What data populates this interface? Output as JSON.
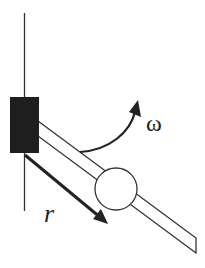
{
  "diagram": {
    "labels": {
      "omega": "ω",
      "r": "r"
    },
    "colors": {
      "ink": "#222222",
      "block": "#1e1e1e",
      "background": "#ffffff"
    },
    "elements": [
      {
        "name": "vertical-axis",
        "type": "line"
      },
      {
        "name": "pivot-block",
        "type": "filled-rectangle"
      },
      {
        "name": "rod",
        "type": "slanted-bar"
      },
      {
        "name": "bead",
        "type": "circle"
      },
      {
        "name": "angular-velocity-arrow",
        "type": "curved-arrow",
        "label": "ω"
      },
      {
        "name": "radial-position-arrow",
        "type": "straight-arrow",
        "label": "r"
      }
    ]
  }
}
